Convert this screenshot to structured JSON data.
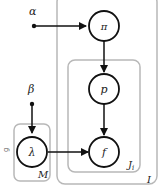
{
  "diagram": {
    "type": "plate-notation",
    "nodes": {
      "alpha": {
        "label": "α",
        "kind": "hyperparameter"
      },
      "beta": {
        "label": "β",
        "kind": "hyperparameter"
      },
      "pi": {
        "label": "π",
        "kind": "latent"
      },
      "p": {
        "label": "p",
        "kind": "latent"
      },
      "lambda": {
        "label": "λ",
        "kind": "latent"
      },
      "f": {
        "label": "f",
        "kind": "observed"
      }
    },
    "plates": {
      "outer": {
        "label": "I"
      },
      "inner": {
        "label": "J",
        "subscript": "i"
      },
      "left": {
        "label": "M"
      }
    },
    "edges": [
      {
        "from": "alpha",
        "to": "pi"
      },
      {
        "from": "pi",
        "to": "p"
      },
      {
        "from": "p",
        "to": "f"
      },
      {
        "from": "beta",
        "to": "lambda"
      },
      {
        "from": "lambda",
        "to": "f"
      }
    ],
    "side_mark": "g",
    "colors": {
      "stroke": "#111111",
      "plate": "#b8b8b8"
    }
  }
}
